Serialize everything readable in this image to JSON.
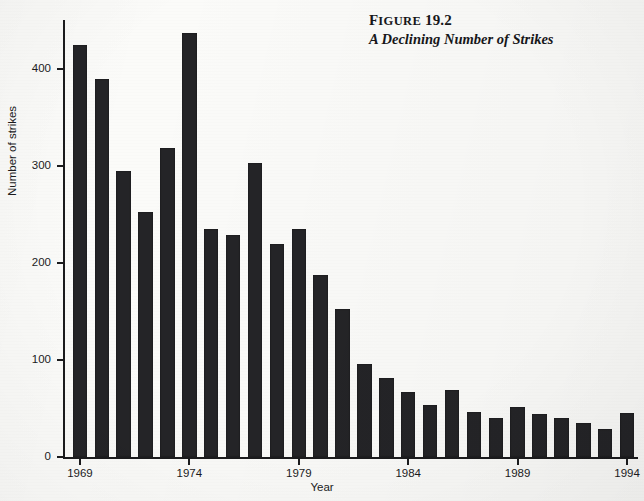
{
  "figure": {
    "title_prefix": "F",
    "title_smallcaps": "IGURE",
    "title_number": "19.2",
    "title_full": "Figure 19.2",
    "subtitle": "A Declining Number of Strikes"
  },
  "colors": {
    "bar": "#242427",
    "axis": "#1b1b1d",
    "background": "#fbfbf9",
    "text": "#17171a"
  },
  "axes": {
    "y_title": "Number of strikes",
    "x_title": "Year",
    "y_ticks": [
      "0",
      "100",
      "200",
      "300",
      "400"
    ],
    "x_ticks": [
      "1969",
      "1974",
      "1979",
      "1984",
      "1989",
      "1994"
    ]
  },
  "chart_data": {
    "type": "bar",
    "subtitle": "A Declining Number of Strikes",
    "xlabel": "Year",
    "ylabel": "Number of strikes",
    "ylim": [
      0,
      450
    ],
    "xlim": [
      1968.5,
      1994.5
    ],
    "grid": false,
    "legend": false,
    "categories": [
      "1969",
      "1970",
      "1971",
      "1972",
      "1973",
      "1974",
      "1975",
      "1976",
      "1977",
      "1978",
      "1979",
      "1980",
      "1981",
      "1982",
      "1983",
      "1984",
      "1985",
      "1986",
      "1987",
      "1988",
      "1989",
      "1990",
      "1991",
      "1992",
      "1993",
      "1994"
    ],
    "values": [
      424,
      389,
      294,
      252,
      318,
      437,
      235,
      229,
      303,
      219,
      235,
      187,
      152,
      96,
      81,
      67,
      54,
      69,
      46,
      40,
      51,
      44,
      40,
      35,
      29,
      45
    ],
    "y_tick_values": [
      0,
      100,
      200,
      300,
      400
    ],
    "x_tick_labels": [
      "1969",
      "1974",
      "1979",
      "1984",
      "1989",
      "1994"
    ],
    "bar_color": "#242427"
  }
}
